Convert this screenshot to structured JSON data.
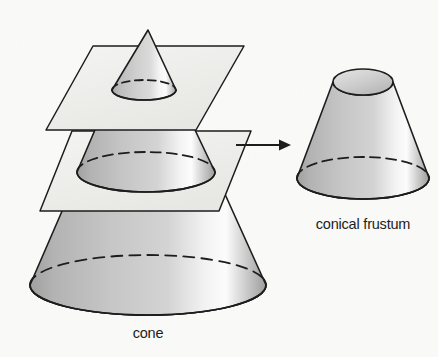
{
  "figure": {
    "background_color": "#fbfbfa",
    "ink_color": "#1d1d1d",
    "labels": {
      "cone": "cone",
      "frustum": "conical frustum"
    },
    "left_diagram": {
      "name": "cone-with-cutting-planes",
      "description": "A cone intersected by two horizontal cutting planes drawn as parallelograms",
      "apex": {
        "x": 148,
        "y": 30
      },
      "base_center": {
        "x": 148,
        "y": 285
      },
      "base_radius_x": 118,
      "base_radius_y": 30,
      "upper_plane": {
        "name": "upper-cutting-plane",
        "cut_center": {
          "x": 144,
          "y": 90
        },
        "cut_radius_x": 32,
        "cut_radius_y": 10
      },
      "lower_plane": {
        "name": "lower-cutting-plane",
        "cut_center": {
          "x": 146,
          "y": 172
        },
        "cut_radius_x": 69,
        "cut_radius_y": 20
      }
    },
    "right_diagram": {
      "name": "conical-frustum",
      "description": "The resulting conical frustum: a cone with its top cut off",
      "top_center": {
        "x": 363,
        "y": 82
      },
      "top_radius_x": 30,
      "top_radius_y": 13,
      "bottom_center": {
        "x": 363,
        "y": 178
      },
      "bottom_radius_x": 66,
      "bottom_radius_y": 21
    },
    "arrow": {
      "name": "transformation-arrow",
      "from": {
        "x": 236,
        "y": 145
      },
      "to": {
        "x": 289,
        "y": 145
      },
      "direction": "right"
    },
    "shading": {
      "surface_light": "#fdfdfd",
      "surface_mid": "#c5c5c5",
      "surface_dark": "#a4a4a4",
      "surface_shadow": "#9a9a9a",
      "plane_fill": "#efefed",
      "ellipse_fill_light": "#dcdcdc",
      "ellipse_fill_dark": "#b4b4b4"
    }
  }
}
